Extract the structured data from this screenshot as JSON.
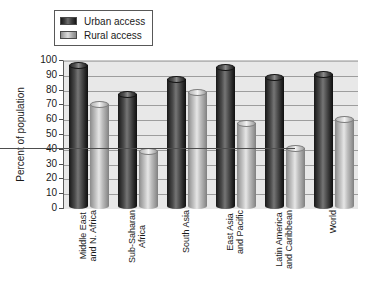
{
  "chart_data": {
    "type": "bar",
    "title": "",
    "subtitle": "",
    "xlabel": "",
    "ylabel": "Percent of population",
    "ylim": [
      0,
      100
    ],
    "ytick_step": 10,
    "yticks": [
      100,
      90,
      80,
      70,
      60,
      50,
      40,
      30,
      20,
      10,
      0
    ],
    "ytick_labels": [
      "100",
      "90",
      "80",
      "70",
      "60",
      "50",
      "40",
      "30",
      "20",
      "10",
      "0"
    ],
    "grid": true,
    "grid_axis": "y",
    "legend_position": "top-left",
    "categories": [
      "Middle East and N. Africa",
      "Sub-Saharan Africa",
      "South Asia",
      "East Asia and Pacific",
      "Latin America and Caribbean",
      "World"
    ],
    "category_lines": [
      [
        "Middle East",
        "and N. Africa"
      ],
      [
        "Sub-Saharan",
        "Africa"
      ],
      [
        "South Asia",
        ""
      ],
      [
        "East Asia",
        "and Pacific"
      ],
      [
        "Latin America",
        "and Caribbean"
      ],
      [
        "World",
        ""
      ]
    ],
    "series": [
      {
        "name": "Urban access",
        "color": "#2b2b2b",
        "values": [
          97,
          78,
          88,
          96,
          89,
          91
        ]
      },
      {
        "name": "Rural access",
        "color": "#c8c8c8",
        "values": [
          71,
          39,
          79,
          58,
          41,
          61
        ]
      }
    ],
    "annotations": []
  },
  "legend": {
    "items": [
      {
        "label": "Urban access",
        "swatch": "urban-access-swatch"
      },
      {
        "label": "Rural access",
        "swatch": "rural-access-swatch"
      }
    ]
  },
  "axes": {
    "y_title": "Percent of population"
  },
  "colors": {
    "plot_background": "#e8e8e8",
    "gridline": "#9d9d9d",
    "axis_line": "#4d4d4d",
    "text": "#1a1a1a",
    "urban_bar": "#2b2b2b",
    "rural_bar": "#c8c8c8",
    "legend_border": "#585858",
    "page_background": "#ffffff"
  }
}
